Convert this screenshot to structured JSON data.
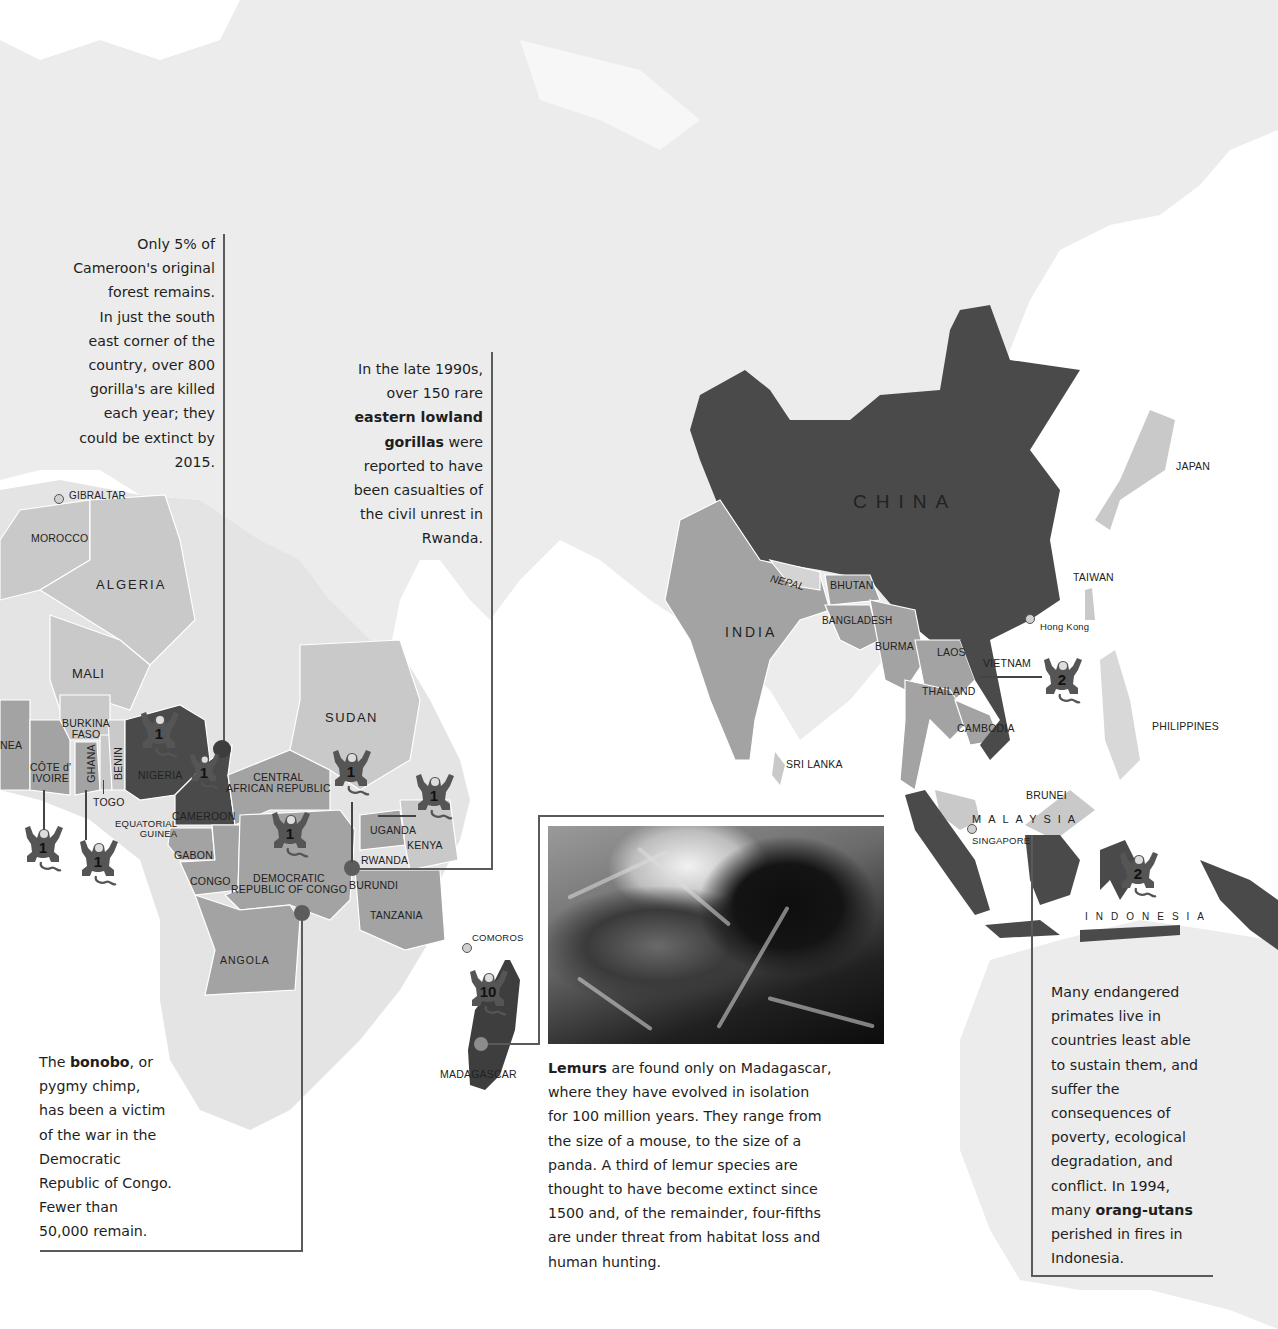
{
  "map": {
    "colors": {
      "land_background": "#ebebeb",
      "country_light": "#c9c9c9",
      "country_mid": "#a3a3a3",
      "country_dark": "#4a4a4a",
      "callout_line": "#5a5a5a",
      "ocean": "#ffffff"
    },
    "countries": {
      "africa": [
        "MOROCCO",
        "ALGERIA",
        "MALI",
        "NEA",
        "BURKINA FASO",
        "CÔTE d' IVOIRE",
        "GHANA",
        "BENIN",
        "TOGO",
        "NIGERIA",
        "CAMEROON",
        "EQUATORIAL GUINEA",
        "GABON",
        "CONGO",
        "CENTRAL AFRICAN REPUBLIC",
        "DEMOCRATIC REPUBLIC OF CONGO",
        "SUDAN",
        "UGANDA",
        "KENYA",
        "RWANDA",
        "BURUNDI",
        "TANZANIA",
        "ANGOLA",
        "MADAGASCAR"
      ],
      "asia": [
        "CHINA",
        "INDIA",
        "NEPAL",
        "BHUTAN",
        "BANGLADESH",
        "BURMA",
        "LAOS",
        "VIETNAM",
        "THAILAND",
        "CAMBODIA",
        "SRI LANKA",
        "MALAYSIA",
        "BRUNEI",
        "INDONESIA",
        "PHILIPPINES",
        "TAIWAN",
        "JAPAN"
      ]
    },
    "labels": {
      "gibraltar": "GIBRALTAR",
      "morocco": "MOROCCO",
      "algeria": "ALGERIA",
      "mali": "MALI",
      "guinea_partial": "NEA",
      "burkina_1": "BURKINA",
      "burkina_2": "FASO",
      "cote_1": "CÔTE d'",
      "cote_2": "IVOIRE",
      "ghana": "GHANA",
      "benin": "BENIN",
      "togo": "TOGO",
      "nigeria": "NIGERIA",
      "cameroon": "CAMEROON",
      "eq_guinea_1": "EQUATORIAL",
      "eq_guinea_2": "GUINEA",
      "gabon": "GABON",
      "congo": "CONGO",
      "car_1": "CENTRAL",
      "car_2": "AFRICAN REPUBLIC",
      "drc_1": "DEMOCRATIC",
      "drc_2": "REPUBLIC OF CONGO",
      "sudan": "SUDAN",
      "uganda": "UGANDA",
      "kenya": "KENYA",
      "rwanda": "RWANDA",
      "burundi": "BURUNDI",
      "tanzania": "TANZANIA",
      "angola": "ANGOLA",
      "comoros": "COMOROS",
      "madagascar": "MADAGASCAR",
      "china": "CHINA",
      "india": "INDIA",
      "nepal": "NEPAL",
      "bhutan": "BHUTAN",
      "bangladesh": "BANGLADESH",
      "burma": "BURMA",
      "laos": "LAOS",
      "vietnam": "VIETNAM",
      "thailand": "THAILAND",
      "cambodia": "CAMBODIA",
      "sri_lanka": "SRI LANKA",
      "hong_kong": "Hong Kong",
      "taiwan": "TAIWAN",
      "japan": "JAPAN",
      "philippines": "PHILIPPINES",
      "brunei": "BRUNEI",
      "malaysia": "MALAYSIA",
      "singapore": "SINGAPORE",
      "indonesia": "INDONESIA"
    },
    "primate_markers": [
      {
        "location": "Nigeria",
        "count": "1"
      },
      {
        "location": "Cameroon",
        "count": "1"
      },
      {
        "location": "Côte d'Ivoire",
        "count": "1"
      },
      {
        "location": "Ghana",
        "count": "1"
      },
      {
        "location": "Democratic Republic of Congo",
        "count": "1"
      },
      {
        "location": "Rwanda",
        "count": "1"
      },
      {
        "location": "Kenya",
        "count": "1"
      },
      {
        "location": "Madagascar",
        "count": "10"
      },
      {
        "location": "Vietnam",
        "count": "2"
      },
      {
        "location": "Indonesia",
        "count": "2"
      }
    ]
  },
  "callouts": {
    "cameroon": {
      "lines": [
        "Only 5% of",
        "Cameroon's original",
        "forest remains.",
        "In just the south",
        "east corner of the",
        "country, over 800",
        "gorilla's are killed",
        "each year; they",
        "could be extinct by",
        "2015."
      ]
    },
    "rwanda": {
      "line1": "In the late 1990s,",
      "line2": "over 150 rare",
      "bold1": "eastern lowland",
      "bold2": "gorillas",
      "line4_rest": " were",
      "line5": "reported to have",
      "line6": "been casualties of",
      "line7": "the civil unrest in",
      "line8": "Rwanda."
    },
    "bonobo": {
      "prefix": "The ",
      "bold": "bonobo",
      "suffix": ", or",
      "lines": [
        "pygmy chimp,",
        "has been a victim",
        "of the war in the",
        "Democratic",
        "Republic of Congo.",
        "Fewer than",
        "50,000 remain."
      ]
    },
    "lemurs": {
      "bold": "Lemurs",
      "first_rest": " are found only on Madagascar,",
      "lines": [
        "where they have evolved in isolation",
        "for 100 million years. They range from",
        "the size of a mouse, to the size of a",
        "panda. A third of lemur species are",
        "thought to have become extinct since",
        "1500 and, of the remainder, four-fifths",
        "are under threat from habitat loss and",
        "human hunting."
      ]
    },
    "indonesia": {
      "lines": [
        "Many endangered",
        "primates live in",
        "countries least able",
        "to sustain them, and",
        "suffer the",
        "consequences of",
        "poverty, ecological",
        "degradation, and",
        "conflict. In 1994,"
      ],
      "prefix": "many ",
      "bold": "orang-utans",
      "after": [
        "perished in fires in",
        "Indonesia."
      ]
    }
  },
  "photo": {
    "subject": "lemur-photo"
  }
}
